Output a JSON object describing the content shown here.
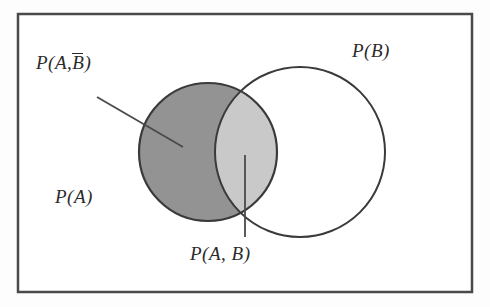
{
  "figure": {
    "frame": {
      "x": 18,
      "y": 14,
      "width": 454,
      "height": 278,
      "stroke": "#4a4a4a",
      "stroke_width": 2.5,
      "fill": "#ffffff"
    },
    "colors": {
      "background": "#fdfdfd",
      "outline": "#3a3a3a",
      "region_a_only_fill": "#939393",
      "region_intersection_fill": "#c9c9c9",
      "region_b_only_fill": "#ffffff",
      "text": "#2b2b2b",
      "leader_line": "#4a4a4a"
    },
    "circles": [
      {
        "name": "circle-a",
        "label": "P(A)",
        "cx": 208,
        "cy": 152,
        "r": 69,
        "filled": true
      },
      {
        "name": "circle-b",
        "label": "P(B)",
        "cx": 300,
        "cy": 152,
        "r": 85,
        "filled": false
      }
    ],
    "leaders": [
      {
        "name": "leader-a-not-b",
        "x1": 97,
        "y1": 97,
        "x2": 183,
        "y2": 147
      },
      {
        "name": "leader-a-and-b",
        "x1": 245,
        "y1": 237,
        "x2": 245,
        "y2": 155
      }
    ]
  },
  "labels": {
    "a_not_b": {
      "prefix": "P(A,",
      "overline_symbol": "B",
      "suffix": ")"
    },
    "b": "P(B)",
    "a": "P(A)",
    "a_and_b": "P(A,  B)"
  }
}
